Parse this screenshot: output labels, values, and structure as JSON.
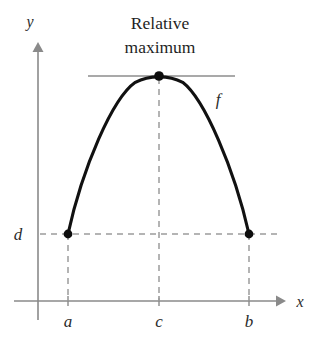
{
  "figure": {
    "kind": "function-graph",
    "background_color": "#ffffff",
    "annotation": {
      "line1": "Relative",
      "line2": "maximum"
    },
    "axes": {
      "x_label": "x",
      "y_label": "y",
      "axis_color": "#8a8a8a",
      "origin_px": {
        "x": 38,
        "y": 301
      },
      "x_axis_span_px": {
        "from": 14,
        "to": 283
      },
      "y_axis_span_px": {
        "from": 45,
        "to": 320
      }
    },
    "curve": {
      "label": "f",
      "color": "#111111",
      "stroke_width": 3.1
    },
    "tangent": {
      "color": "#8d8d8d",
      "y_px": 76,
      "x_from_px": 88,
      "x_to_px": 235
    },
    "guides": {
      "color": "#9c9c9c",
      "dash": "6 5"
    },
    "x_ticks": [
      {
        "label": "a",
        "x_px": 68
      },
      {
        "label": "c",
        "x_px": 159
      },
      {
        "label": "b",
        "x_px": 249
      }
    ],
    "y_ticks": [
      {
        "label": "d",
        "y_px": 234
      }
    ],
    "points": [
      {
        "name": "left-endpoint",
        "x_px": 68,
        "y_px": 234,
        "x_label": "a",
        "y_label": "d"
      },
      {
        "name": "relative-maximum-vertex",
        "x_px": 159,
        "y_px": 76,
        "x_label": "c"
      },
      {
        "name": "right-endpoint",
        "x_px": 249,
        "y_px": 234,
        "x_label": "b",
        "y_label": "d"
      }
    ]
  },
  "chart_data": {
    "type": "line",
    "xlabel": "x",
    "ylabel": "y",
    "grid": false,
    "legend": "none",
    "series": [
      {
        "name": "f",
        "x": [
          "a",
          "c",
          "b"
        ],
        "y": [
          "d",
          "relative maximum",
          "d"
        ]
      }
    ],
    "annotations": [
      {
        "text": "Relative maximum",
        "at": "c",
        "kind": "callout"
      },
      {
        "text": "f",
        "at": "curve right branch",
        "kind": "curve-label"
      }
    ],
    "xtick_labels": [
      "a",
      "c",
      "b"
    ],
    "ytick_labels": [
      "d"
    ]
  }
}
